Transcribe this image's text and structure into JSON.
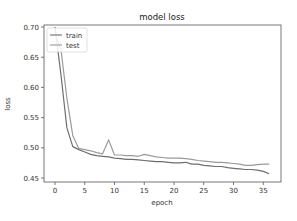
{
  "chart_data": {
    "type": "line",
    "title": "model loss",
    "xlabel": "epoch",
    "ylabel": "loss",
    "xlim": [
      -2,
      38
    ],
    "ylim": [
      0.445,
      0.705
    ],
    "xticks": [
      0,
      5,
      10,
      15,
      20,
      25,
      30,
      35
    ],
    "yticks": [
      0.45,
      0.5,
      0.55,
      0.6,
      0.65,
      0.7
    ],
    "ytick_labels": [
      "0.45",
      "0.50",
      "0.55",
      "0.60",
      "0.65",
      "0.70"
    ],
    "grid": false,
    "legend_position": "upper left",
    "x": [
      0,
      1,
      2,
      3,
      4,
      5,
      6,
      7,
      8,
      9,
      10,
      11,
      12,
      13,
      14,
      15,
      16,
      17,
      18,
      19,
      20,
      21,
      22,
      23,
      24,
      25,
      26,
      27,
      28,
      29,
      30,
      31,
      32,
      33,
      34,
      35,
      36
    ],
    "series": [
      {
        "name": "train",
        "color": "#6e6e6e",
        "values": [
          0.7,
          0.62,
          0.533,
          0.502,
          0.497,
          0.493,
          0.489,
          0.487,
          0.486,
          0.485,
          0.483,
          0.482,
          0.481,
          0.481,
          0.48,
          0.479,
          0.478,
          0.477,
          0.477,
          0.476,
          0.475,
          0.475,
          0.476,
          0.473,
          0.473,
          0.471,
          0.47,
          0.469,
          0.469,
          0.467,
          0.466,
          0.465,
          0.464,
          0.464,
          0.463,
          0.461,
          0.457
        ]
      },
      {
        "name": "test",
        "color": "#9a9a9a",
        "values": [
          0.69,
          0.662,
          0.582,
          0.52,
          0.499,
          0.497,
          0.495,
          0.492,
          0.49,
          0.513,
          0.488,
          0.488,
          0.487,
          0.487,
          0.486,
          0.489,
          0.487,
          0.485,
          0.484,
          0.483,
          0.483,
          0.483,
          0.482,
          0.481,
          0.479,
          0.478,
          0.477,
          0.476,
          0.476,
          0.475,
          0.474,
          0.473,
          0.471,
          0.471,
          0.472,
          0.473,
          0.473
        ]
      }
    ]
  }
}
